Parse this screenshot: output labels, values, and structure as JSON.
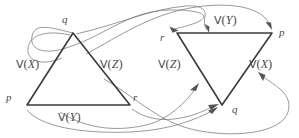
{
  "figure": {
    "name": "two-triangle-mapping-diagram",
    "width": 299,
    "height": 138,
    "background": "#ffffff",
    "edge_stroke": "#3a3a3a",
    "arrow_stroke": "#777777",
    "text_color": "#4a4a4a"
  },
  "left_triangle": {
    "name": "left-triangle",
    "vertices": {
      "q": {
        "label": "q",
        "x": 73,
        "y": 33
      },
      "p": {
        "label": "p",
        "x": 27,
        "y": 105
      },
      "r": {
        "label": "r",
        "x": 130,
        "y": 105
      }
    },
    "edges": {
      "left": {
        "label_v": "V",
        "label_open": "(",
        "label_var": "X",
        "label_close": ")",
        "full": "V(X)"
      },
      "right": {
        "label_v": "V",
        "label_open": "(",
        "label_var": "Z",
        "label_close": ")",
        "full": "V(Z)"
      },
      "bottom": {
        "label_v": "V",
        "label_open": "(",
        "label_var": "Y",
        "label_close": ")",
        "full": "V(Y)"
      }
    }
  },
  "right_triangle": {
    "name": "right-triangle",
    "vertices": {
      "r": {
        "label": "r",
        "x": 177,
        "y": 33
      },
      "p": {
        "label": "p",
        "x": 272,
        "y": 33
      },
      "q": {
        "label": "q",
        "x": 222,
        "y": 105
      }
    },
    "edges": {
      "top": {
        "label_v": "V",
        "label_open": "(",
        "label_var": "Y",
        "label_close": ")",
        "full": "V(Y)"
      },
      "left": {
        "label_v": "V",
        "label_open": "(",
        "label_var": "Z",
        "label_close": ")",
        "full": "V(Z)"
      },
      "right": {
        "label_v": "V",
        "label_open": "(",
        "label_var": "X",
        "label_close": ")",
        "full": "V(X)"
      }
    }
  },
  "mappings": [
    {
      "name": "map-q-to-r",
      "from": "left.q",
      "to": "right.r"
    },
    {
      "name": "map-q-to-top-edge",
      "from": "left.q",
      "to": "right.top-edge"
    },
    {
      "name": "map-p-to-p",
      "from": "left.p",
      "to": "right.p"
    },
    {
      "name": "map-r-to-q",
      "from": "left.r",
      "to": "right.q"
    },
    {
      "name": "map-bottom-edge-to-left-edge",
      "from": "left.bottom-edge",
      "to": "right.left-edge"
    },
    {
      "name": "map-right-edge-to-right-edge",
      "from": "left.right-edge",
      "to": "right.right-edge"
    }
  ]
}
